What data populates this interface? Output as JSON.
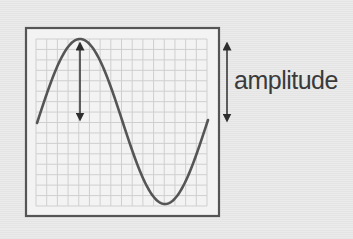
{
  "diagram": {
    "title": "",
    "label": "amplitude",
    "colors": {
      "background": "#e8e8e8",
      "panel": "#f3f3f3",
      "grid": "#cfcfcf",
      "frame": "#555555",
      "wave": "#555555",
      "arrow": "#2e2e2e",
      "text": "#3a3a3a"
    },
    "frame": {
      "x": 26,
      "y": 28,
      "width": 193,
      "height": 188
    },
    "grid": {
      "x": 36,
      "y": 39,
      "width": 171,
      "height": 167,
      "cols": 16,
      "rows": 16
    },
    "wave": {
      "type": "sine",
      "x_start": 37,
      "x_end": 208,
      "peak": {
        "x": 80,
        "y": 39
      },
      "trough": {
        "x": 165,
        "y": 204
      },
      "midline_y": 122
    },
    "inner_arrow": {
      "x": 80,
      "y_top": 42,
      "y_bottom": 121
    },
    "side_arrow": {
      "x": 227,
      "y_top": 42,
      "y_bottom": 122
    }
  }
}
